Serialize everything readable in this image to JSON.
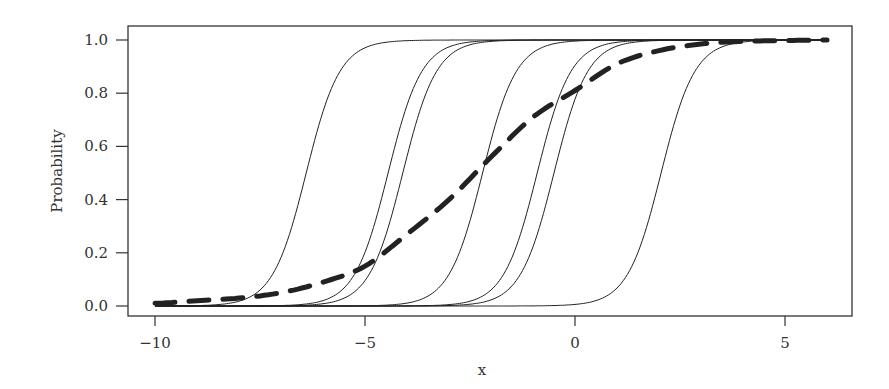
{
  "chart_data": {
    "type": "line",
    "title": "",
    "xlabel": "x",
    "ylabel": "Probability",
    "xlim": [
      -10.6,
      6.6
    ],
    "ylim": [
      -0.03,
      1.03
    ],
    "x_ticks": [
      -10,
      -5,
      0,
      5
    ],
    "x_tick_labels": [
      "−10",
      "−5",
      "0",
      "5"
    ],
    "y_ticks": [
      0.0,
      0.2,
      0.4,
      0.6,
      0.8,
      1.0
    ],
    "y_tick_labels": [
      "0.0",
      "0.2",
      "0.4",
      "0.6",
      "0.8",
      "1.0"
    ],
    "grid": false,
    "legend": null,
    "x_range_plotted": [
      -10,
      6
    ],
    "series": [
      {
        "name": "curve-1",
        "style": "solid-thin",
        "shape": "logistic",
        "midpoint": -6.4,
        "scale": 0.4
      },
      {
        "name": "curve-2",
        "style": "solid-thin",
        "shape": "logistic",
        "midpoint": -4.45,
        "scale": 0.4
      },
      {
        "name": "curve-3",
        "style": "solid-thin",
        "shape": "logistic",
        "midpoint": -4.1,
        "scale": 0.4
      },
      {
        "name": "curve-4",
        "style": "solid-thin",
        "shape": "logistic",
        "midpoint": -2.2,
        "scale": 0.4
      },
      {
        "name": "curve-5",
        "style": "solid-thin",
        "shape": "logistic",
        "midpoint": -0.9,
        "scale": 0.4
      },
      {
        "name": "curve-6",
        "style": "solid-thin",
        "shape": "logistic",
        "midpoint": -0.5,
        "scale": 0.4
      },
      {
        "name": "curve-7",
        "style": "solid-thin",
        "shape": "logistic",
        "midpoint": 2.05,
        "scale": 0.4
      },
      {
        "name": "average-curve",
        "style": "dashed-thick",
        "x": [
          -10,
          -9,
          -8,
          -7,
          -6,
          -5,
          -4,
          -3,
          -2,
          -1,
          0,
          1,
          2,
          3,
          4,
          5,
          6
        ],
        "values": [
          0.01,
          0.02,
          0.03,
          0.05,
          0.09,
          0.15,
          0.27,
          0.4,
          0.56,
          0.71,
          0.81,
          0.91,
          0.96,
          0.985,
          0.995,
          0.998,
          1.0
        ]
      }
    ]
  },
  "colors": {
    "line": "#222222",
    "axis": "#333333",
    "background": "#ffffff"
  }
}
